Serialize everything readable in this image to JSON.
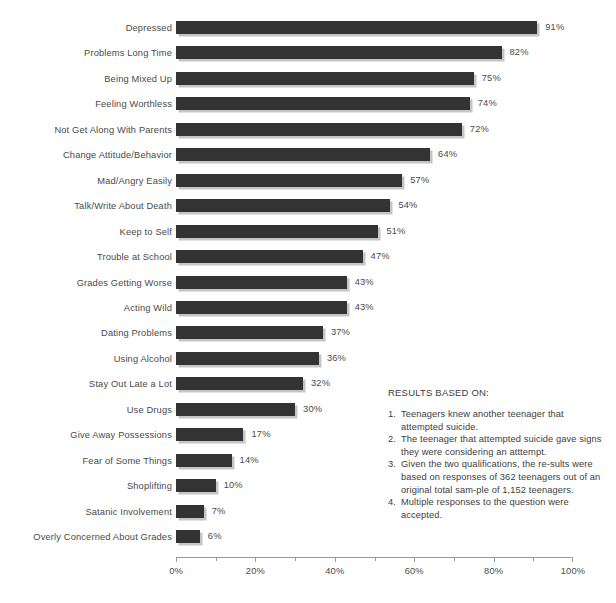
{
  "chart_data": {
    "type": "bar",
    "orientation": "horizontal",
    "title": "",
    "xlabel": "",
    "ylabel": "",
    "xlim": [
      0,
      100
    ],
    "grid": false,
    "legend": null,
    "value_suffix": "%",
    "categories": [
      "Depressed",
      "Problems Long Time",
      "Being Mixed Up",
      "Feeling Worthless",
      "Not Get Along With Parents",
      "Change Attitude/Behavior",
      "Mad/Angry Easily",
      "Talk/Write About Death",
      "Keep to Self",
      "Trouble at School",
      "Grades Getting Worse",
      "Acting Wild",
      "Dating Problems",
      "Using Alcohol",
      "Stay Out Late a Lot",
      "Use Drugs",
      "Give Away Possessions",
      "Fear of Some Things",
      "Shoplifting",
      "Satanic Involvement",
      "Overly Concerned About Grades"
    ],
    "values": [
      91,
      82,
      75,
      74,
      72,
      64,
      57,
      54,
      51,
      47,
      43,
      43,
      37,
      36,
      32,
      30,
      17,
      14,
      10,
      7,
      6
    ],
    "value_labels": [
      "91%",
      "82%",
      "75%",
      "74%",
      "72%",
      "64%",
      "57%",
      "54%",
      "51%",
      "47%",
      "43%",
      "43%",
      "37%",
      "36%",
      "32%",
      "30%",
      "17%",
      "14%",
      "10%",
      "7%",
      "6%"
    ],
    "xticks": [
      0,
      20,
      40,
      60,
      80,
      100
    ],
    "xtick_labels": [
      "0%",
      "20%",
      "40%",
      "60%",
      "80%",
      "100%"
    ],
    "minor_xticks": [
      10,
      30,
      50,
      70,
      90
    ],
    "bar_color": "#333333",
    "text_color": "#4a4a4a",
    "background_color": "#ffffff"
  },
  "notes": {
    "title": "RESULTS BASED ON:",
    "items": [
      {
        "num": "1.",
        "text": "Teenagers knew another teenager that attempted suicide."
      },
      {
        "num": "2.",
        "text": "The teenager that attempted suicide gave signs they were considering an atttempt."
      },
      {
        "num": "3.",
        "text": "Given the two qualifications, the re-sults were based on responses of 362 teenagers out of an original total sam-ple of 1,152 teenagers."
      },
      {
        "num": "4.",
        "text": "Multiple responses to the question were accepted."
      }
    ]
  }
}
